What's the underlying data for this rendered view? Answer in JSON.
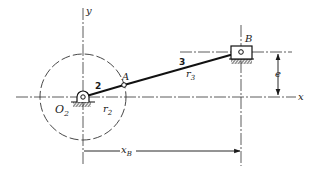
{
  "diagram": {
    "type": "offset slider-crank mechanism",
    "colors": {
      "ink": "#1a1a1a",
      "background": "#ffffff"
    },
    "axes": {
      "x_label": "x",
      "y_label": "y"
    },
    "points": {
      "ground_pivot": {
        "label": "O",
        "subscript": "2"
      },
      "crank_pin": {
        "label": "A"
      },
      "slider_pin": {
        "label": "B"
      }
    },
    "links": {
      "crank": {
        "number": "2",
        "length_label": "r",
        "length_subscript": "2"
      },
      "connecting_rod": {
        "number": "3",
        "length_label": "r",
        "length_subscript": "3"
      }
    },
    "dimensions": {
      "offset": {
        "label": "e"
      },
      "slider_position": {
        "label": "x",
        "subscript": "B"
      }
    }
  }
}
